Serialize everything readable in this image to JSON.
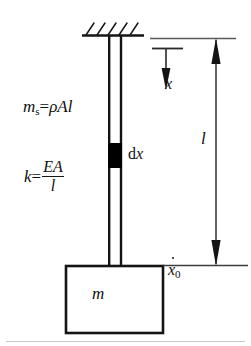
{
  "figure": {
    "background": "#ffffff",
    "stroke_color": "#141414",
    "fill_color": "#000000",
    "width": 251,
    "height": 346
  },
  "labels": {
    "bar_mass": {
      "symbol": "m",
      "subscript": "s",
      "equals": "=",
      "expression": "ρAl",
      "rho": "ρ",
      "area": "A",
      "length": "l",
      "full_text": "m_s=ρAl"
    },
    "stiffness": {
      "symbol": "k",
      "equals": "=",
      "numerator": "EA",
      "denominator": "l",
      "full_text": "k=EA/l"
    },
    "element": {
      "text": "dx",
      "d": "d",
      "x": "x"
    },
    "coordinate": {
      "text": "x"
    },
    "length_dimension": {
      "text": "l"
    },
    "base_velocity": {
      "text": "ẋ₀",
      "base": "x",
      "subscript": "0"
    },
    "end_mass": {
      "text": "m"
    }
  },
  "parts": {
    "support": "fixed-hatched-ceiling",
    "bar": "hollow-vertical-bar",
    "element_strip": "filled-dx-element",
    "block": "rectangular-end-mass",
    "coordinate_arrow": "downward-arrow-x",
    "dimension_arrow": "double-ended-length-l",
    "reference_line_top": "upper-datum-line",
    "reference_line_bottom": "lower-datum-line"
  }
}
